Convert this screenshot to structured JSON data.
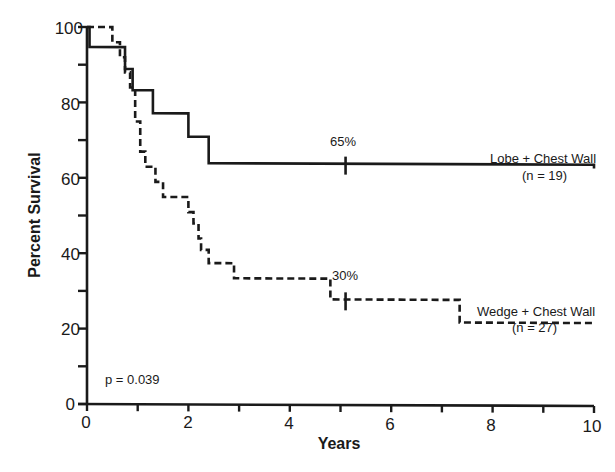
{
  "chart_data": {
    "type": "line",
    "subtype": "kaplan-meier-step",
    "title": "",
    "xlabel": "Years",
    "ylabel": "Percent Survival",
    "xlim": [
      0,
      10
    ],
    "ylim": [
      0,
      100
    ],
    "x_ticks_labeled": [
      0,
      2,
      4,
      6,
      8,
      10
    ],
    "x_ticks_minor": [
      1,
      3,
      5,
      7,
      9
    ],
    "y_ticks_labeled": [
      0,
      20,
      40,
      60,
      80,
      100
    ],
    "y_ticks_minor": [
      10,
      30,
      50,
      70,
      90
    ],
    "grid": false,
    "series": [
      {
        "name": "Lobe + Chest Wall",
        "n_label": "(n = 19)",
        "style": "solid",
        "steps": [
          [
            0,
            100
          ],
          [
            0.05,
            94.7
          ],
          [
            0.75,
            88.9
          ],
          [
            0.9,
            83.3
          ],
          [
            1.3,
            77.2
          ],
          [
            2.0,
            71.0
          ],
          [
            2.4,
            64.0
          ],
          [
            10,
            63.0
          ]
        ],
        "censor_marks": [
          [
            5.1,
            63.5
          ]
        ],
        "annotation": "65%"
      },
      {
        "name": "Wedge + Chest Wall",
        "n_label": "(n = 27)",
        "style": "dashed",
        "steps": [
          [
            0,
            100
          ],
          [
            0.4,
            100
          ],
          [
            0.5,
            96
          ],
          [
            0.65,
            92
          ],
          [
            0.75,
            88
          ],
          [
            0.85,
            84
          ],
          [
            0.95,
            75
          ],
          [
            1.05,
            67
          ],
          [
            1.15,
            63
          ],
          [
            1.35,
            59
          ],
          [
            1.5,
            55
          ],
          [
            2.0,
            51
          ],
          [
            2.1,
            48
          ],
          [
            2.2,
            44
          ],
          [
            2.25,
            41
          ],
          [
            2.4,
            37.5
          ],
          [
            2.9,
            33.5
          ],
          [
            4.8,
            28
          ],
          [
            7.35,
            22
          ],
          [
            10,
            21.5
          ]
        ],
        "censor_marks": [
          [
            5.1,
            27.5
          ]
        ],
        "annotation": "30%"
      }
    ],
    "annotations": [
      {
        "text": "p = 0.039",
        "x": 0.5,
        "y": 7
      }
    ]
  },
  "labels": {
    "ylabel": "Percent Survival",
    "xlabel": "Years",
    "p_value": "p = 0.039",
    "lobe_name": "Lobe + Chest Wall",
    "lobe_n": "(n = 19)",
    "lobe_pct": "65%",
    "wedge_name": "Wedge + Chest Wall",
    "wedge_n": "(n = 27)",
    "wedge_pct": "30%",
    "x_ticks": [
      "0",
      "2",
      "4",
      "6",
      "8",
      "10"
    ],
    "y_ticks": [
      "0",
      "20",
      "40",
      "60",
      "80",
      "100"
    ]
  }
}
